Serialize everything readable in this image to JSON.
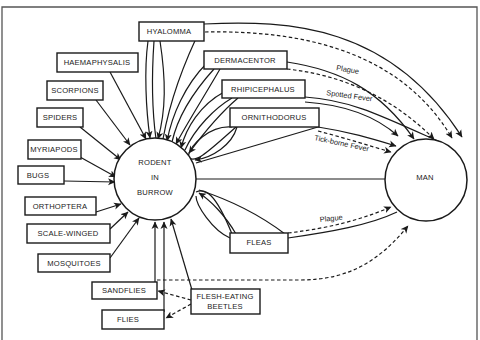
{
  "diagram": {
    "center_node": {
      "line1": "RODENT",
      "line2": "IN",
      "line3": "BURROW"
    },
    "target_node": {
      "label": "MAN"
    },
    "vectors": {
      "hyalomma": "HYALOMMA",
      "haemaphysalis": "HAEMAPHYSALIS",
      "scorpions": "SCORPIONS",
      "spiders": "SPIDERS",
      "myriapods": "MYRIAPODS",
      "bugs": "BUGS",
      "orthoptera": "ORTHOPTERA",
      "scale_winged": "SCALE-WINGED",
      "mosquitoes": "MOSQUITOES",
      "sandflies": "SANDFLIES",
      "flies": "FLIES",
      "flesh_eating_beetles_line1": "FLESH-EATING",
      "flesh_eating_beetles_line2": "BEETLES",
      "dermacentor": "DERMACENTOR",
      "rhipicephalus": "RHIPICEPHALUS",
      "ornithodorus": "ORNITHODORUS",
      "fleas": "FLEAS"
    },
    "edge_labels": {
      "dermacentor_plague": "Plague",
      "rhipicephalus_spotted_fever": "Spotted Fever",
      "ornithodorus_tick_borne_fever": "Tick-borne Fever",
      "fleas_plague": "Plague"
    },
    "legend": {
      "solid_line": "direct relationship",
      "dashed_line": "disease transmission"
    }
  }
}
